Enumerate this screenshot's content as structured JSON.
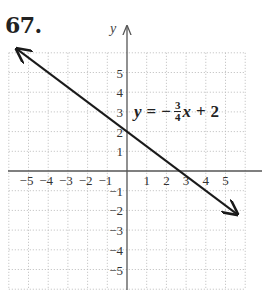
{
  "problem": {
    "number": "67."
  },
  "equation": {
    "lhs": "y",
    "equals": "=",
    "sign": "−",
    "numerator": "3",
    "denominator": "4",
    "variable": "x",
    "plus": "+",
    "constant": "2",
    "full_text": "y = −(3/4)x + 2"
  },
  "axes": {
    "y_label": "y",
    "x_ticks": [
      "−5",
      "−4",
      "−3",
      "−2",
      "−1",
      "1",
      "2",
      "3",
      "4",
      "5"
    ],
    "y_ticks": [
      "5",
      "4",
      "3",
      "2",
      "1",
      "−1",
      "−2",
      "−3",
      "−4",
      "−5"
    ]
  },
  "colors": {
    "line": "#1a1a1a",
    "axis": "#555555",
    "grid": "#bbbbbb"
  },
  "chart_data": {
    "type": "line",
    "title": "67.",
    "equation": "y = -3/4 x + 2",
    "slope": -0.75,
    "y_intercept": 2,
    "x_intercept": 2.6667,
    "x": [
      -5.6,
      -4,
      0,
      2.6667,
      4,
      5.6
    ],
    "y": [
      6.2,
      5,
      2,
      0,
      -1,
      -2.2
    ],
    "series": [
      {
        "name": "y = -3/4x + 2",
        "x": [
          -5.6,
          5.6
        ],
        "y": [
          6.2,
          -2.2
        ],
        "arrows_both_ends": true
      }
    ],
    "xlabel": "",
    "ylabel": "y",
    "xlim": [
      -6,
      6
    ],
    "ylim": [
      -6,
      6.5
    ],
    "x_tick_labels": [
      -5,
      -4,
      -3,
      -2,
      -1,
      1,
      2,
      3,
      4,
      5
    ],
    "y_tick_labels": [
      5,
      4,
      3,
      2,
      1,
      -1,
      -2,
      -3,
      -4,
      -5
    ],
    "grid": true,
    "grid_style": "dotted"
  }
}
